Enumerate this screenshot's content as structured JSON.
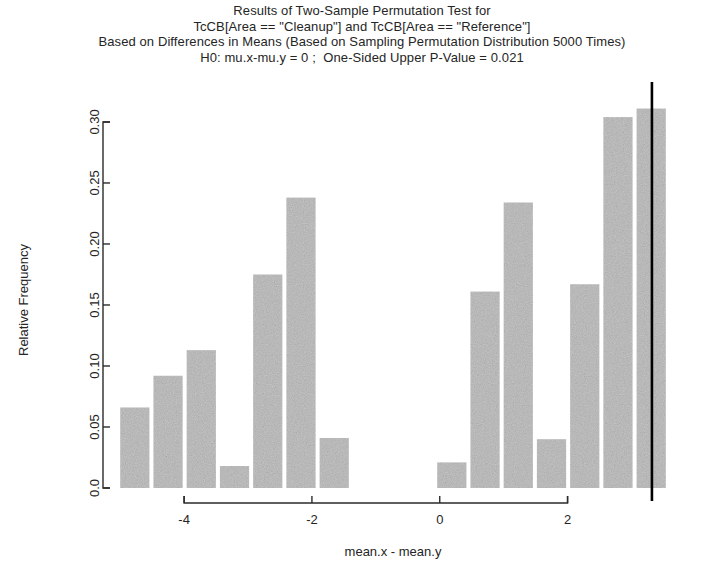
{
  "title": {
    "line1": "Results of Two-Sample Permutation Test for",
    "line2": "TcCB[Area == \"Cleanup\"] and TcCB[Area == \"Reference\"]",
    "line3": "Based on Differences in Means (Based on Sampling Permutation Distribution 5000 Times)",
    "line4": "H0: mu.x-mu.y = 0 ;  One-Sided Upper P-Value = 0.021"
  },
  "colors": {
    "bar_fill": "#b5b5b5",
    "bar_noise": "#8f8f8f",
    "axis": "#2b2b2b",
    "reference_line": "#000000",
    "background": "#ffffff",
    "text": "#252525"
  },
  "axes": {
    "x_label": "mean.x - mean.y",
    "y_label": "Relative Frequency",
    "x_ticks": [
      "-4",
      "-2",
      "0",
      "2"
    ],
    "x_tick_values": [
      -4,
      -2,
      0,
      2
    ],
    "y_ticks": [
      "0.0",
      "0.05",
      "0.10",
      "0.15",
      "0.20",
      "0.25",
      "0.30"
    ],
    "y_tick_values": [
      0.0,
      0.05,
      0.1,
      0.15,
      0.2,
      0.25,
      0.3
    ]
  },
  "annotations": {
    "reference_line_label": "observed-statistic-line",
    "reference_line_x": 3.32,
    "p_value": 0.021,
    "n_permutations": 5000
  },
  "chart_data": {
    "type": "bar",
    "title": "Results of Two-Sample Permutation Test for TcCB[Area == \"Cleanup\"] and TcCB[Area == \"Reference\"]",
    "subtitle": "Based on Differences in Means (Based on Sampling Permutation Distribution 5000 Times)",
    "annotation": "H0: mu.x-mu.y = 0 ;  One-Sided Upper P-Value = 0.021",
    "xlabel": "mean.x - mean.y",
    "ylabel": "Relative Frequency",
    "xlim": [
      -5.05,
      3.9
    ],
    "ylim": [
      0.0,
      0.318
    ],
    "grid": false,
    "legend": null,
    "bin_width": 0.52,
    "x": [
      -4.74,
      -4.22,
      -3.7,
      -3.18,
      -2.66,
      -2.14,
      -1.62,
      0.22,
      0.74,
      1.26,
      1.78,
      2.3,
      2.82,
      3.34
    ],
    "bar_left_edges": [
      -5.0,
      -4.48,
      -3.96,
      -3.44,
      -2.92,
      -2.4,
      -1.88,
      -0.04,
      0.48,
      1.0,
      1.52,
      2.04,
      2.56,
      3.08
    ],
    "values": [
      0.066,
      0.092,
      0.113,
      0.018,
      0.175,
      0.238,
      0.041,
      0.021,
      0.161,
      0.234,
      0.04,
      0.167,
      0.304,
      0.311
    ],
    "categories": [
      "-4.74",
      "-4.22",
      "-3.70",
      "-3.18",
      "-2.66",
      "-2.14",
      "-1.62",
      "0.22",
      "0.74",
      "1.26",
      "1.78",
      "2.30",
      "2.82",
      "3.34"
    ]
  }
}
